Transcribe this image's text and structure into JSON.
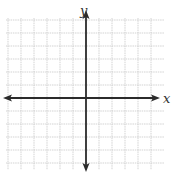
{
  "diagram": {
    "type": "coordinate-plane",
    "x_axis_label": "x",
    "y_axis_label": "y",
    "grid": {
      "vertical_lines_x": [
        8,
        21,
        34,
        47,
        60,
        73,
        99,
        112,
        125,
        138,
        151
      ],
      "horizontal_lines_y": [
        20,
        33,
        46,
        59,
        72,
        85,
        111,
        124,
        137,
        150,
        163
      ],
      "extent": {
        "x_min": 6,
        "x_max": 164,
        "y_min": 18,
        "y_max": 170
      },
      "color": "#c8c8c8"
    },
    "origin": {
      "x": 86,
      "y": 98
    },
    "axes": {
      "color": "#2b2b2b",
      "x_axis": {
        "from": 3,
        "to": 160,
        "arrows": "both"
      },
      "y_axis": {
        "from": 10,
        "to": 172,
        "arrows": "both"
      }
    }
  }
}
